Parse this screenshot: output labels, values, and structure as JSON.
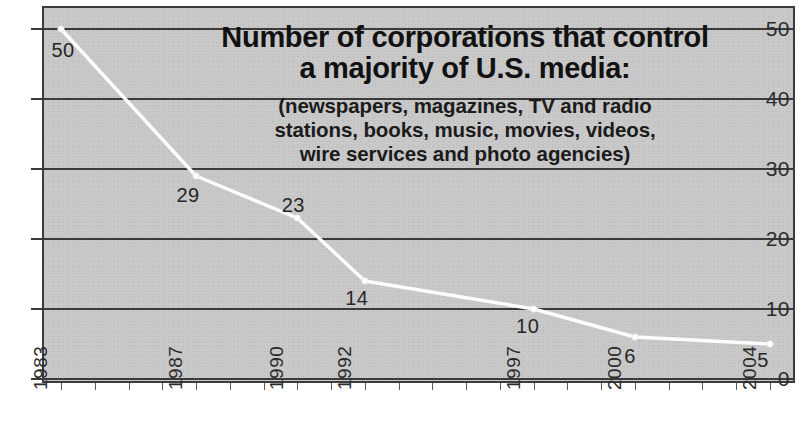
{
  "chart_data": {
    "type": "line",
    "title": "Number of corporations that control a majority of U.S. media:",
    "title_lines": [
      "Number of corporations that control",
      "a majority of U.S. media:"
    ],
    "subtitle": "(newspapers, magazines, TV and radio stations, books, music, movies, videos, wire services and photo agencies)",
    "subtitle_lines": [
      "(newspapers, magazines, TV and radio",
      "stations, books, music, movies, videos,",
      "wire services and photo agencies)"
    ],
    "xlabel": "",
    "ylabel": "",
    "categories": [
      "1983",
      "1987",
      "1990",
      "1992",
      "1997",
      "2000",
      "2004"
    ],
    "x": [
      1983,
      1987,
      1990,
      1992,
      1997,
      2000,
      2004
    ],
    "values": [
      50,
      29,
      23,
      14,
      10,
      6,
      5
    ],
    "point_labels": [
      "50",
      "29",
      "23",
      "14",
      "10",
      "6",
      "5"
    ],
    "ylim": [
      0,
      50
    ],
    "xlim": [
      1983,
      2004
    ],
    "y_ticks": [
      "0",
      "10",
      "20",
      "30",
      "40",
      "50"
    ],
    "y_tick_values": [
      0,
      10,
      20,
      30,
      40,
      50
    ],
    "grid": true,
    "legend": "none",
    "series_color": "#ffffff",
    "plot_background": "#c9c9c9",
    "grid_color": "#3a3a3a",
    "text_color": "#1b1b1b"
  }
}
